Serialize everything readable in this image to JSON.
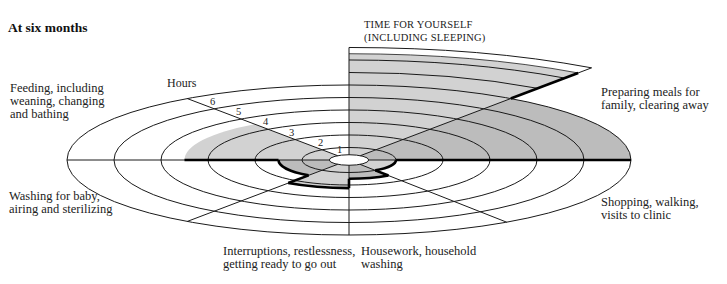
{
  "title": "At six months",
  "axis_label": "Hours",
  "colors": {
    "light": "#d2d2d2",
    "medium": "#bcbcbc",
    "line": "#1a1a1a",
    "hole": "#ffffff"
  },
  "labels": {
    "time_for_yourself": [
      "TIME FOR YOURSELF",
      "(INCLUDING SLEEPING)"
    ],
    "preparing_meals": [
      "Preparing meals for",
      "family, clearing away"
    ],
    "shopping": [
      "Shopping, walking,",
      "visits to clinic"
    ],
    "housework": [
      "Housework, household",
      "washing"
    ],
    "interruptions": [
      "Interruptions, restlessness,",
      "getting ready to go out"
    ],
    "washing": [
      "Washing for baby,",
      "airing and sterilizing"
    ],
    "feeding": [
      "Feeding, including",
      "weaning, changing",
      "and bathing"
    ]
  },
  "ticks": [
    "1",
    "2",
    "3",
    "4",
    "5",
    "6"
  ],
  "chart_data": {
    "type": "polar-area",
    "title": "At six months",
    "radial_label": "Hours",
    "radial_ticks": [
      1,
      2,
      3,
      4,
      5,
      6
    ],
    "radial_range": [
      0,
      6
    ],
    "geometry": {
      "cx": 349,
      "cy": 160,
      "px_per_hour": 47,
      "aspect": 0.266,
      "hole_hours": 0.42
    },
    "sectors": [
      {
        "name": "Time for yourself (including sleeping)",
        "start_deg": 90,
        "end_deg": 55,
        "hours": 8.5,
        "shade": "light"
      },
      {
        "name": "Preparing meals for family, clearing away",
        "start_deg": 55,
        "end_deg": 0,
        "hours": 6.0,
        "shade": "medium"
      },
      {
        "name": "Shopping, walking, visits to clinic",
        "start_deg": 0,
        "end_deg": -56,
        "hours": 1.0,
        "shade": "light"
      },
      {
        "name": "Housework, household washing",
        "start_deg": -56,
        "end_deg": -90,
        "hours": 1.5,
        "shade": "medium"
      },
      {
        "name": "Interruptions, restlessness, getting ready to go out",
        "start_deg": -90,
        "end_deg": -125,
        "hours": 2.25,
        "shade": "light"
      },
      {
        "name": "Washing for baby, airing and sterilizing",
        "start_deg": -125,
        "end_deg": -180,
        "hours": 1.5,
        "shade": "medium"
      },
      {
        "name": "Feeding, including weaning, changing and bathing",
        "start_deg": 180,
        "end_deg": 125,
        "hours": 3.5,
        "shade": "light"
      }
    ],
    "extra_rings_in_first_sector": [
      7,
      8,
      9
    ],
    "radial_axis_angle_deg": 125,
    "grid": true,
    "legend": "none"
  }
}
